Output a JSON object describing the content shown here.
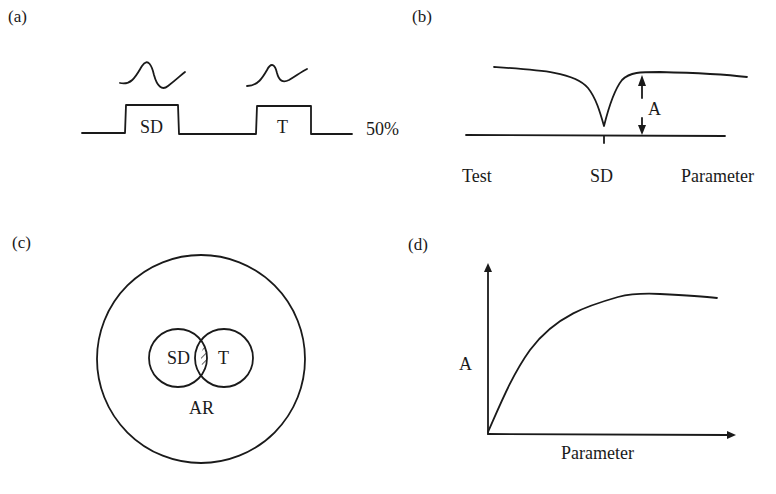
{
  "panels": {
    "a": {
      "label": "(a)",
      "pulse1_label": "SD",
      "pulse2_label": "T",
      "level_label": "50%"
    },
    "b": {
      "label": "(b)",
      "amplitude_label": "A",
      "x_left": "Test",
      "x_center": "SD",
      "x_right": "Parameter"
    },
    "c": {
      "label": "(c)",
      "circle_left": "SD",
      "circle_right": "T",
      "outer_label": "AR"
    },
    "d": {
      "label": "(d)",
      "ylabel": "A",
      "xlabel": "Parameter"
    }
  },
  "colors": {
    "ink": "#1a1a1a",
    "background": "#ffffff"
  }
}
